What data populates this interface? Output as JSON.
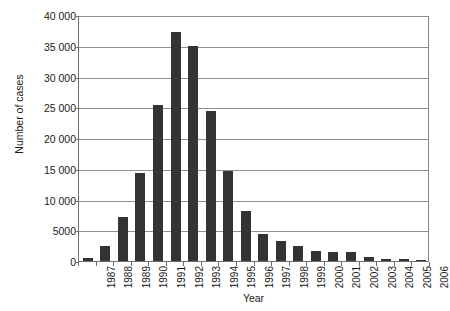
{
  "chart_data": {
    "type": "bar",
    "title": "",
    "xlabel": "Year",
    "ylabel": "Number of cases",
    "categories": [
      "1987",
      "1988",
      "1989",
      "1990",
      "1991",
      "1992",
      "1993",
      "1994",
      "1995",
      "1996",
      "1997",
      "1998",
      "1999",
      "2000",
      "2001",
      "2002",
      "2003",
      "2004",
      "2005",
      "2006"
    ],
    "values": [
      500,
      2500,
      7200,
      14300,
      25400,
      37300,
      35000,
      24400,
      14600,
      8200,
      4400,
      3200,
      2400,
      1600,
      1400,
      1400,
      600,
      350,
      300,
      200
    ],
    "series": [
      {
        "name": "Number of cases",
        "values": [
          500,
          2500,
          7200,
          14300,
          25400,
          37300,
          35000,
          24400,
          14600,
          8200,
          4400,
          3200,
          2400,
          1600,
          1400,
          1400,
          600,
          350,
          300,
          200
        ]
      }
    ],
    "ylim": [
      0,
      40000
    ],
    "ytick_values": [
      0,
      5000,
      10000,
      15000,
      20000,
      25000,
      30000,
      35000,
      40000
    ],
    "ytick_labels": [
      "0",
      "5000",
      "10 000",
      "15 000",
      "20 000",
      "25 000",
      "30 000",
      "35 000",
      "40 000"
    ],
    "grid": "horizontal",
    "legend": "none",
    "bar_color": "#333333",
    "axis_color": "#6e6e6e",
    "grid_color": "#8f8f8f",
    "background": "#ffffff"
  }
}
